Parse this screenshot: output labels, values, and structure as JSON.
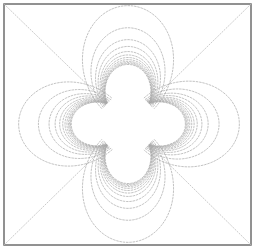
{
  "figure": {
    "title": ""
  },
  "colors": {
    "background": "#ffffff",
    "frame": "#6e6e6e",
    "lines": "#a8a8a8",
    "diagonals": "#bdbdbd",
    "hole": "#ffffff"
  },
  "geometry": {
    "frame": {
      "x": 4,
      "y": 4,
      "width": 247,
      "height": 241
    },
    "center": {
      "x": 128,
      "y": 124
    },
    "hole_radius": 29
  },
  "chart_data": {
    "type": "diagram",
    "title": "",
    "xlabel": "",
    "ylabel": "",
    "grid": false,
    "legend": null,
    "lobes": [
      {
        "name": "top",
        "angle_deg": -90,
        "extent_px": 114
      },
      {
        "name": "right",
        "angle_deg": 0,
        "extent_px": 107
      },
      {
        "name": "bottom",
        "angle_deg": 90,
        "extent_px": 114
      },
      {
        "name": "left",
        "angle_deg": 180,
        "extent_px": 105
      }
    ],
    "lines_per_lobe_scales": [
      1.0,
      0.74,
      0.6,
      0.52,
      0.46,
      0.42,
      0.39,
      0.365,
      0.345,
      0.33,
      0.318,
      0.308
    ],
    "diagonals": true
  }
}
